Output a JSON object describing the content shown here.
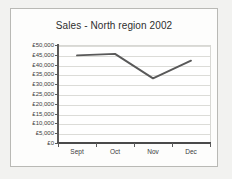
{
  "chart_data": {
    "type": "line",
    "title": "Sales - North region 2002",
    "xlabel": "",
    "ylabel": "",
    "categories": [
      "Sept",
      "Oct",
      "Nov",
      "Dec"
    ],
    "values": [
      45200,
      46000,
      33500,
      42500
    ],
    "series": [
      {
        "name": "Sales",
        "values": [
          45200,
          46000,
          33500,
          42500
        ]
      }
    ],
    "ylim": [
      0,
      50000
    ],
    "ytick_values": [
      0,
      5000,
      10000,
      15000,
      20000,
      25000,
      30000,
      35000,
      40000,
      45000,
      50000
    ],
    "ytick_labels": [
      "£0",
      "£5,000",
      "£10,000",
      "£15,000",
      "£20,000",
      "£25,000",
      "£30,000",
      "£35,000",
      "£40,000",
      "£45,000",
      "£50,000"
    ],
    "currency_symbol": "£",
    "grid": true,
    "legend": false,
    "legend_position": "none",
    "markers": false,
    "line_color": "#595959",
    "plot_background": "#ffffff",
    "chart_background": "#fdfdfc",
    "page_background": "#f2f2f0",
    "gridline_color": "#dcdcd8",
    "axis_color": "#5a5a5a",
    "text_color": "#3b3b3b"
  }
}
